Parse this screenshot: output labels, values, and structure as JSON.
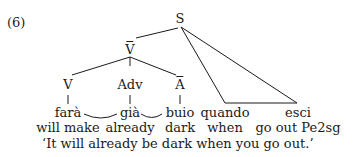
{
  "example": {
    "number": "(6)",
    "translation": "‘It will already be dark when you go out.’"
  },
  "tree": {
    "root": "S",
    "vbar": "V",
    "abar": "A",
    "nodes": {
      "V": "V",
      "Adv": "Adv"
    },
    "leaves": [
      {
        "word": "farà",
        "gloss": "will make"
      },
      {
        "word": "già",
        "gloss": "already"
      },
      {
        "word": "buio",
        "gloss": "dark"
      },
      {
        "word": "quando",
        "gloss": "when"
      },
      {
        "word": "esci",
        "gloss": "go out Pe2sg"
      }
    ]
  }
}
